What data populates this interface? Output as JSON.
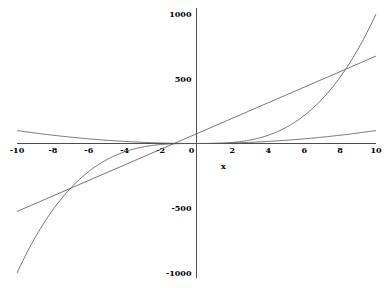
{
  "chart_data": {
    "type": "line",
    "title": "",
    "xlabel": "x",
    "ylabel": "",
    "xlim": [
      -10,
      10
    ],
    "ylim": [
      -1000,
      1000
    ],
    "grid": false,
    "legend": null,
    "x_ticks": [
      "-10",
      "-8",
      "-6",
      "-4",
      "-2",
      "0",
      "2",
      "4",
      "6",
      "8",
      "10"
    ],
    "y_ticks": [
      "1000",
      "500",
      "-500",
      "-1000"
    ],
    "series": [
      {
        "name": "x^3",
        "x": [
          -10,
          -8,
          -6,
          -4,
          -2,
          0,
          2,
          4,
          6,
          8,
          10
        ],
        "values": [
          -1000,
          -512,
          -216,
          -64,
          -8,
          0,
          8,
          64,
          216,
          512,
          1000
        ]
      },
      {
        "name": "x^2",
        "x": [
          -10,
          -8,
          -6,
          -4,
          -2,
          0,
          2,
          4,
          6,
          8,
          10
        ],
        "values": [
          100,
          64,
          36,
          16,
          4,
          0,
          4,
          16,
          36,
          64,
          100
        ]
      },
      {
        "name": "line",
        "x": [
          -10,
          10
        ],
        "values": [
          -525,
          675
        ]
      }
    ]
  }
}
